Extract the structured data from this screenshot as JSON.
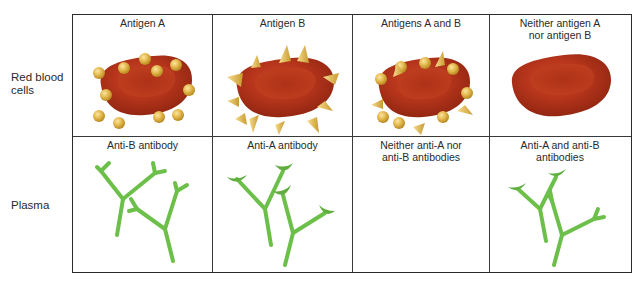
{
  "row_labels": {
    "red_blood_cells": "Red blood\ncells",
    "red_blood_cells_line1": "Red blood",
    "red_blood_cells_line2": "cells",
    "plasma": "Plasma"
  },
  "columns": [
    {
      "rbc_title_line1": "Antigen A",
      "rbc_title_line2": "",
      "rbc_surface": "antigen-A-spheres",
      "plasma_title_line1": "Anti-B antibody",
      "plasma_title_line2": "",
      "plasma_content": "anti-B-antibodies"
    },
    {
      "rbc_title_line1": "Antigen B",
      "rbc_title_line2": "",
      "rbc_surface": "antigen-B-spikes",
      "plasma_title_line1": "Anti-A antibody",
      "plasma_title_line2": "",
      "plasma_content": "anti-A-antibodies"
    },
    {
      "rbc_title_line1": "Antigens A and B",
      "rbc_title_line2": "",
      "rbc_surface": "antigen-A-and-B",
      "plasma_title_line1": "Neither anti-A nor",
      "plasma_title_line2": "anti-B antibodies",
      "plasma_content": "none"
    },
    {
      "rbc_title_line1": "Neither antigen A",
      "rbc_title_line2": "nor antigen B",
      "rbc_surface": "none",
      "plasma_title_line1": "Anti-A and anti-B",
      "plasma_title_line2": "antibodies",
      "plasma_content": "anti-A-and-anti-B-antibodies"
    }
  ],
  "colors": {
    "cell_red": "#b8361c",
    "cell_dark": "#8e2410",
    "antigen_gold": "#e2b54a",
    "antibody_green": "#6cc04a",
    "grid_line": "#2b2b2b"
  }
}
